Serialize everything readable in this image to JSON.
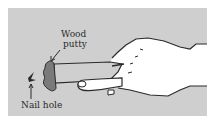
{
  "illustration": {
    "subject": "Applying wood putty to a nail hole with a putty knife held by a hand",
    "labels": {
      "wood": "Wood",
      "putty": "putty",
      "nail_hole": "Nail hole"
    },
    "colors": {
      "background": "#cfcfcf",
      "outline": "#2a2a2a",
      "hand_fill": "#ffffff",
      "putty_fill": "#7a7a7a"
    }
  }
}
